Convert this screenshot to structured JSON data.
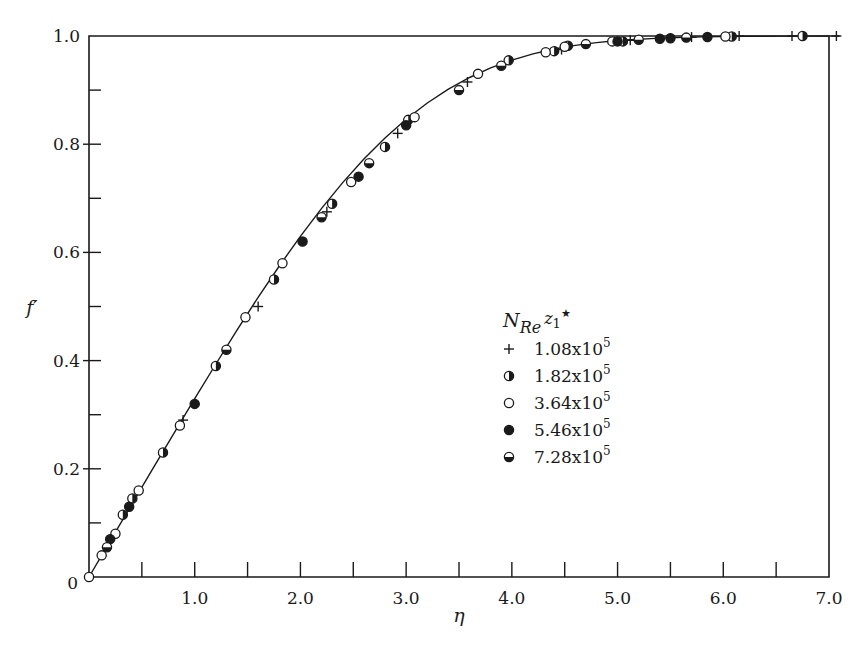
{
  "chart_data": {
    "type": "scatter",
    "title": "",
    "xlabel": "η",
    "ylabel": "f′",
    "xlim": [
      0,
      7.0
    ],
    "ylim": [
      0,
      1.0
    ],
    "grid": false,
    "legend_position": "center-right",
    "x_tick_labels": [
      "1.0",
      "2.0",
      "3.0",
      "4.0",
      "5.0",
      "6.0",
      "7.0"
    ],
    "x_ticks_major": [
      1,
      2,
      3,
      4,
      5,
      6,
      7
    ],
    "x_ticks_minor": [
      0.5,
      1.5,
      2.5,
      3.5,
      4.5,
      5.5,
      6.5
    ],
    "y_tick_labels": [
      "0",
      "0.2",
      "0.4",
      "0.6",
      "0.8",
      "1.0"
    ],
    "y_ticks_major": [
      0,
      0.2,
      0.4,
      0.6,
      0.8,
      1.0
    ],
    "y_ticks_minor": [
      0.1,
      0.3,
      0.5,
      0.7,
      0.9
    ],
    "legend": {
      "title_main": "N",
      "title_sub": "Re",
      "title_sup_base": "z",
      "title_sup_sub": "1",
      "title_star": "★",
      "entries": [
        {
          "marker": "plus",
          "label_base": "1.08x10",
          "label_exp": "5"
        },
        {
          "marker": "half-right",
          "label_base": "1.82x10",
          "label_exp": "5"
        },
        {
          "marker": "open",
          "label_base": "3.64x10",
          "label_exp": "5"
        },
        {
          "marker": "filled",
          "label_base": "5.46x10",
          "label_exp": "5"
        },
        {
          "marker": "half-bottom",
          "label_base": "7.28x10",
          "label_exp": "5"
        }
      ]
    },
    "series": [
      {
        "name": "1.08x10^5",
        "marker": "plus",
        "points": [
          [
            0.89,
            0.29
          ],
          [
            1.6,
            0.5
          ],
          [
            2.25,
            0.675
          ],
          [
            2.92,
            0.82
          ],
          [
            3.58,
            0.915
          ],
          [
            4.47,
            0.975
          ],
          [
            5.12,
            0.992
          ],
          [
            5.7,
            0.998
          ],
          [
            6.15,
            1.0
          ],
          [
            6.65,
            1.0
          ],
          [
            7.07,
            1.0
          ]
        ]
      },
      {
        "name": "1.82x10^5",
        "marker": "half-right",
        "points": [
          [
            0.32,
            0.115
          ],
          [
            0.41,
            0.145
          ],
          [
            0.7,
            0.23
          ],
          [
            1.2,
            0.39
          ],
          [
            1.75,
            0.55
          ],
          [
            2.3,
            0.69
          ],
          [
            2.8,
            0.795
          ],
          [
            3.02,
            0.845
          ],
          [
            3.97,
            0.955
          ],
          [
            4.4,
            0.972
          ],
          [
            4.53,
            0.982
          ],
          [
            5.05,
            0.99
          ],
          [
            6.08,
            0.999
          ],
          [
            6.75,
            1.0
          ]
        ]
      },
      {
        "name": "3.64x10^5",
        "marker": "open",
        "points": [
          [
            0.0,
            0.0
          ],
          [
            0.12,
            0.04
          ],
          [
            0.25,
            0.08
          ],
          [
            0.47,
            0.16
          ],
          [
            0.86,
            0.28
          ],
          [
            1.48,
            0.48
          ],
          [
            1.83,
            0.58
          ],
          [
            2.48,
            0.73
          ],
          [
            3.08,
            0.85
          ],
          [
            3.68,
            0.93
          ],
          [
            4.32,
            0.97
          ],
          [
            4.5,
            0.98
          ],
          [
            4.95,
            0.99
          ],
          [
            6.02,
            0.999
          ]
        ]
      },
      {
        "name": "5.46x10^5",
        "marker": "filled",
        "points": [
          [
            0.2,
            0.07
          ],
          [
            0.38,
            0.13
          ],
          [
            1.0,
            0.32
          ],
          [
            2.02,
            0.62
          ],
          [
            2.55,
            0.74
          ],
          [
            3.0,
            0.835
          ],
          [
            5.0,
            0.99
          ],
          [
            5.4,
            0.995
          ],
          [
            5.5,
            0.996
          ],
          [
            5.85,
            0.998
          ]
        ]
      },
      {
        "name": "7.28x10^5",
        "marker": "half-bottom",
        "points": [
          [
            0.17,
            0.055
          ],
          [
            1.3,
            0.42
          ],
          [
            2.2,
            0.665
          ],
          [
            2.65,
            0.765
          ],
          [
            3.5,
            0.9
          ],
          [
            3.9,
            0.945
          ],
          [
            4.7,
            0.985
          ],
          [
            5.2,
            0.993
          ],
          [
            5.65,
            0.997
          ]
        ]
      }
    ],
    "curve": {
      "description": "Blasius boundary-layer velocity profile f'(η)",
      "x": [
        0,
        0.2,
        0.4,
        0.6,
        0.8,
        1.0,
        1.2,
        1.4,
        1.6,
        1.8,
        2.0,
        2.2,
        2.4,
        2.6,
        2.8,
        3.0,
        3.2,
        3.4,
        3.6,
        3.8,
        4.0,
        4.2,
        4.4,
        4.6,
        4.8,
        5.0,
        5.4,
        5.8,
        6.2,
        6.6,
        7.0
      ],
      "y": [
        0,
        0.0664,
        0.1328,
        0.1989,
        0.2647,
        0.3298,
        0.3938,
        0.4563,
        0.5168,
        0.5748,
        0.6298,
        0.6813,
        0.729,
        0.7725,
        0.8115,
        0.8461,
        0.8761,
        0.9018,
        0.9233,
        0.9411,
        0.9555,
        0.967,
        0.9759,
        0.9827,
        0.9878,
        0.9916,
        0.9962,
        0.9984,
        0.9994,
        0.9998,
        1.0
      ]
    }
  }
}
